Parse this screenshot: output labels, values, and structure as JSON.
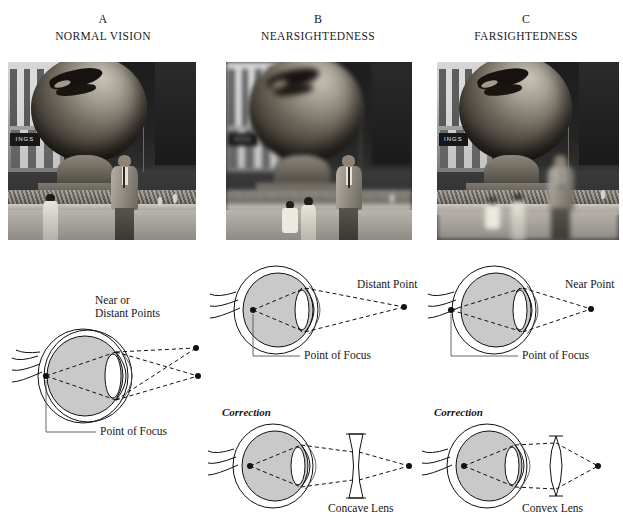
{
  "columns": [
    {
      "letter": "A",
      "title": "NORMAL VISION",
      "photo_alt": "sharp black and white photograph of a man in a suit standing in front of a large spherical sculpture",
      "diagram": {
        "source_label": "Near or\nDistant Points",
        "source_label_line1": "Near or",
        "source_label_line2": "Distant Points",
        "focus_label": "Point of Focus"
      },
      "correction": null
    },
    {
      "letter": "B",
      "title": "NEARSIGHTEDNESS",
      "photo_alt": "black and white photograph with blurred background; the man in the foreground is sharp",
      "diagram": {
        "source_label": "Distant Point",
        "source_label_line1": "Distant Point",
        "source_label_line2": "",
        "focus_label": "Point of Focus"
      },
      "correction": {
        "heading": "Correction",
        "lens_label": "Concave Lens",
        "lens_type": "concave"
      }
    },
    {
      "letter": "C",
      "title": "FARSIGHTEDNESS",
      "photo_alt": "black and white photograph with blurred foreground; the background sculpture is sharp",
      "diagram": {
        "source_label": "Near Point",
        "source_label_line1": "Near Point",
        "source_label_line2": "",
        "focus_label": "Point of Focus"
      },
      "correction": {
        "heading": "Correction",
        "lens_label": "Convex Lens",
        "lens_type": "convex"
      }
    }
  ],
  "photo_scene": {
    "sign_text": "INGS"
  },
  "colors": {
    "background": "#ffffff",
    "ink": "#111111",
    "eye_fill": "#c9c9c9",
    "label_text": "#161616"
  }
}
